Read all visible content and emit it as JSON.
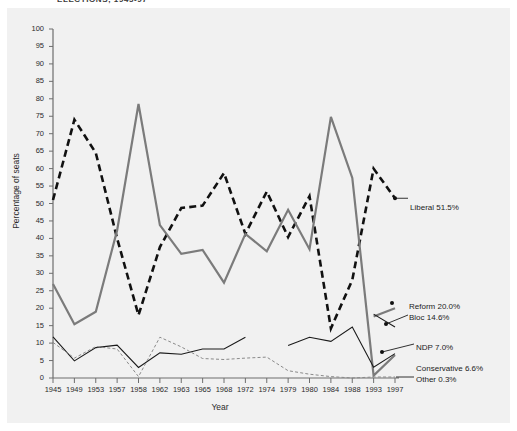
{
  "title": "ELECTIONS, 1945-97",
  "axes": {
    "y_title": "Percentage of seats",
    "x_title": "Year",
    "y_ticks": [
      "0",
      "5",
      "10",
      "15",
      "20",
      "25",
      "30",
      "35",
      "40",
      "45",
      "50",
      "55",
      "60",
      "65",
      "70",
      "75",
      "80",
      "85",
      "90",
      "95",
      "100"
    ],
    "x_ticks": [
      "1945",
      "1949",
      "1953",
      "1957",
      "1958",
      "1962",
      "1963",
      "1965",
      "1968",
      "1972",
      "1974",
      "1979",
      "1980",
      "1984",
      "1988",
      "1993",
      "1997"
    ]
  },
  "annotations": [
    {
      "id": "liberal",
      "label": "Liberal 51.5%"
    },
    {
      "id": "reform",
      "label": "Reform 20.0%"
    },
    {
      "id": "bloc",
      "label": "Bloc 14.6%"
    },
    {
      "id": "ndp",
      "label": "NDP 7.0%"
    },
    {
      "id": "conservative",
      "label": "Conservative 6.6%"
    },
    {
      "id": "other",
      "label": "Other 0.3%"
    }
  ],
  "chart_data": {
    "type": "line",
    "title": "ELECTIONS, 1945-97",
    "xlabel": "Year",
    "ylabel": "Percentage of seats",
    "ylim": [
      0,
      100
    ],
    "ytick_step": 5,
    "grid": false,
    "legend_position": "right-inline-annotations",
    "categories": [
      "1945",
      "1949",
      "1953",
      "1957",
      "1958",
      "1962",
      "1963",
      "1965",
      "1968",
      "1972",
      "1974",
      "1979",
      "1980",
      "1984",
      "1988",
      "1993",
      "1997"
    ],
    "series": [
      {
        "name": "Liberal",
        "style": "thick-dashed",
        "color": "#111111",
        "final_value": 51.5,
        "values": [
          51.0,
          74.0,
          64.5,
          40.0,
          18.0,
          37.5,
          48.7,
          49.4,
          58.7,
          41.3,
          53.4,
          40.4,
          52.1,
          14.2,
          28.1,
          60.0,
          51.5
        ]
      },
      {
        "name": "Conservative",
        "style": "thick-solid",
        "color": "#7b7b7b",
        "final_value": 6.6,
        "values": [
          26.9,
          15.4,
          19.0,
          42.3,
          78.5,
          43.8,
          35.6,
          36.7,
          27.3,
          41.3,
          36.3,
          48.2,
          36.9,
          74.8,
          57.3,
          0.7,
          6.6
        ]
      },
      {
        "name": "NDP",
        "style": "thin-solid",
        "color": "#1a1a1a",
        "final_value": 7.0,
        "values": [
          11.8,
          4.9,
          8.7,
          9.4,
          3.0,
          7.2,
          6.8,
          8.3,
          8.3,
          11.7,
          599,
          9.3,
          11.7,
          10.5,
          14.6,
          3.1,
          7.0
        ]
      },
      {
        "name": "Other",
        "style": "thin-dashed",
        "color": "#8a8a8a",
        "final_value": 0.3,
        "values": [
          10.2,
          5.7,
          9.0,
          8.3,
          0.4,
          11.7,
          8.9,
          5.6,
          5.3,
          5.7,
          6.0,
          2.1,
          1.1,
          0.4,
          0.0,
          0.3,
          0.3
        ]
      },
      {
        "name": "Reform",
        "style": "thick-solid-partial",
        "color": "#7b7b7b",
        "final_value": 20.0,
        "values": [
          null,
          null,
          null,
          null,
          null,
          null,
          null,
          null,
          null,
          null,
          null,
          null,
          null,
          null,
          null,
          17.6,
          20.0
        ]
      },
      {
        "name": "Bloc",
        "style": "thin-solid-partial",
        "color": "#1a1a1a",
        "final_value": 14.6,
        "values": [
          null,
          null,
          null,
          null,
          null,
          null,
          null,
          null,
          null,
          null,
          null,
          null,
          null,
          null,
          null,
          18.3,
          14.6
        ]
      }
    ]
  }
}
